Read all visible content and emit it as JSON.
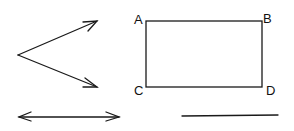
{
  "figure": {
    "labels": {
      "a": "A",
      "b": "B",
      "c": "C",
      "d": "D"
    },
    "shapes": [
      "angle-with-arrows",
      "double-headed-arrow",
      "rectangle-ABCD",
      "line-segment"
    ],
    "stroke_color": "#1a1a1a"
  }
}
